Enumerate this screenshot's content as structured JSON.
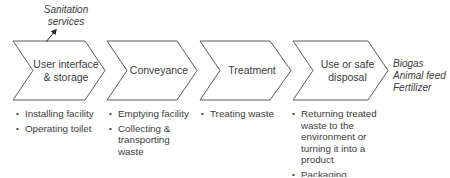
{
  "input_label": {
    "line1": "Sanitation",
    "line2": "services"
  },
  "stages": [
    {
      "label_line1": "User interface",
      "label_line2": "& storage",
      "bullets": [
        "Installing facility",
        "Operating toilet"
      ]
    },
    {
      "label_line1": "Conveyance",
      "label_line2": "",
      "bullets": [
        "Emptying facility",
        "Collecting & transporting waste"
      ]
    },
    {
      "label_line1": "Treatment",
      "label_line2": "",
      "bullets": [
        "Treating waste"
      ]
    },
    {
      "label_line1": "Use or safe",
      "label_line2": "disposal",
      "bullets": [
        "Returning treated waste to the environment or turning it into a product",
        "Packaging, distributing/ selling product"
      ]
    }
  ],
  "outputs": [
    "Biogas",
    "Animal feed",
    "Fertilizer"
  ],
  "colors": {
    "stroke": "#4a4a4a",
    "text": "#3a3a3a"
  }
}
